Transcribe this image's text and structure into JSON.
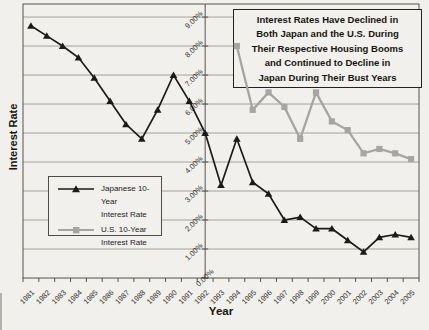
{
  "page": {
    "background_color": "#f1f0ec"
  },
  "title_box": {
    "lines": [
      "Interest Rates Have Declined in",
      "Both Japan and the U.S. During",
      "Their Respective Housing Booms",
      "and Continued to Decline in",
      "Japan During Their Bust Years"
    ]
  },
  "axes": {
    "y_title": "Interest Rate",
    "x_title": "Year"
  },
  "legend": {
    "items": [
      {
        "label_line1": "Japanese 10-Year",
        "label_line2": "Interest Rate",
        "marker": "triangle",
        "color": "#1c1b19"
      },
      {
        "label_line1": "U.S. 10-Year",
        "label_line2": "Interest Rate",
        "marker": "square",
        "color": "#a7a5a1"
      }
    ]
  },
  "chart_data": {
    "type": "line",
    "title": "Interest Rates Have Declined in Both Japan and the U.S. During Their Respective Housing Booms and Continued to Decline in Japan During Their Bust Years",
    "xlabel": "Year",
    "ylabel": "Interest Rate",
    "categories": [
      "1981",
      "1982",
      "1983",
      "1984",
      "1985",
      "1986",
      "1987",
      "1988",
      "1989",
      "1990",
      "1991",
      "1992",
      "1993",
      "1994",
      "1995",
      "1996",
      "1997",
      "1998",
      "1999",
      "2000",
      "2001",
      "2002",
      "2003",
      "2004",
      "2005"
    ],
    "series": [
      {
        "name": "Japanese 10-Year Interest Rate",
        "marker": "triangle",
        "color": "#1c1b19",
        "values": [
          8.7,
          8.35,
          8.0,
          7.6,
          6.9,
          6.1,
          5.3,
          4.8,
          5.8,
          7.0,
          6.1,
          5.0,
          3.2,
          4.8,
          3.3,
          2.9,
          2.0,
          2.1,
          1.7,
          1.7,
          1.3,
          0.9,
          1.4,
          1.5,
          1.4
        ]
      },
      {
        "name": "U.S. 10-Year Interest Rate",
        "marker": "square",
        "color": "#a7a5a1",
        "values": [
          null,
          null,
          null,
          null,
          null,
          null,
          null,
          null,
          null,
          null,
          null,
          null,
          null,
          8.0,
          5.8,
          6.4,
          5.9,
          4.8,
          6.4,
          5.4,
          5.1,
          4.3,
          4.45,
          4.3,
          4.1
        ]
      }
    ],
    "ylim": [
      0,
      9.45
    ],
    "y_ticks": [
      0,
      1,
      2,
      3,
      4,
      5,
      6,
      7,
      8,
      9
    ],
    "y_tick_labels": [
      "0.00%",
      "1.00%",
      "2.00%",
      "3.00%",
      "4.00%",
      "5.00%",
      "6.00%",
      "7.00%",
      "8.00%",
      "9.00%"
    ],
    "grid": true,
    "legend_position": "middle-left",
    "value_axis_crosses_between": [
      "1992",
      "1993"
    ]
  }
}
